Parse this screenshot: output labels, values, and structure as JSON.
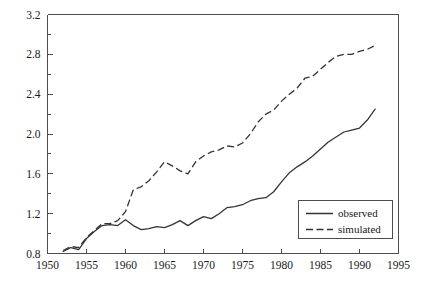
{
  "chart_data": {
    "type": "line",
    "title": "",
    "xlabel": "",
    "ylabel": "",
    "xlim": [
      1950,
      1995
    ],
    "ylim": [
      0.8,
      3.2
    ],
    "grid": false,
    "legend_position": "bottom-right",
    "x_ticks": [
      1950,
      1955,
      1960,
      1965,
      1970,
      1975,
      1980,
      1985,
      1990,
      1995
    ],
    "x_tick_labels": [
      "1950",
      "1955",
      "1960",
      "1965",
      "1970",
      "1975",
      "1980",
      "1985",
      "1990",
      "1995"
    ],
    "y_ticks": [
      0.8,
      1.2,
      1.6,
      2.0,
      2.4,
      2.8,
      3.2
    ],
    "y_tick_labels": [
      "0.8",
      "1.2",
      "1.6",
      "2.0",
      "2.4",
      "2.8",
      "3.2"
    ],
    "y_minor_ticks": [
      1.0,
      1.4,
      1.8,
      2.2,
      2.6,
      3.0
    ],
    "x": [
      1952,
      1953,
      1954,
      1955,
      1956,
      1957,
      1958,
      1959,
      1960,
      1961,
      1962,
      1963,
      1964,
      1965,
      1966,
      1967,
      1968,
      1969,
      1970,
      1971,
      1972,
      1973,
      1974,
      1975,
      1976,
      1977,
      1978,
      1979,
      1980,
      1981,
      1982,
      1983,
      1984,
      1985,
      1986,
      1987,
      1988,
      1989,
      1990,
      1991,
      1992
    ],
    "series": [
      {
        "name": "observed",
        "style": "solid",
        "color": "#333333",
        "values": [
          0.82,
          0.86,
          0.84,
          0.95,
          1.02,
          1.08,
          1.09,
          1.08,
          1.14,
          1.08,
          1.04,
          1.05,
          1.07,
          1.06,
          1.09,
          1.13,
          1.08,
          1.13,
          1.17,
          1.15,
          1.2,
          1.26,
          1.27,
          1.29,
          1.33,
          1.35,
          1.36,
          1.42,
          1.52,
          1.61,
          1.67,
          1.72,
          1.78,
          1.85,
          1.92,
          1.97,
          2.02,
          2.04,
          2.06,
          2.14,
          2.25
        ]
      },
      {
        "name": "simulated",
        "style": "dashed",
        "color": "#333333",
        "values": [
          0.83,
          0.87,
          0.86,
          0.96,
          1.03,
          1.1,
          1.1,
          1.13,
          1.22,
          1.44,
          1.47,
          1.53,
          1.62,
          1.72,
          1.68,
          1.63,
          1.6,
          1.72,
          1.78,
          1.82,
          1.84,
          1.88,
          1.87,
          1.91,
          2.0,
          2.12,
          2.2,
          2.24,
          2.33,
          2.4,
          2.46,
          2.56,
          2.58,
          2.65,
          2.72,
          2.78,
          2.8,
          2.8,
          2.83,
          2.85,
          2.89
        ]
      }
    ],
    "legend": [
      {
        "label": "observed",
        "style": "solid"
      },
      {
        "label": "simulated",
        "style": "dashed"
      }
    ]
  },
  "axes": {
    "x_tick_labels": [
      "1950",
      "1955",
      "1960",
      "1965",
      "1970",
      "1975",
      "1980",
      "1985",
      "1990",
      "1995"
    ],
    "y_tick_labels": [
      "0.8",
      "1.2",
      "1.6",
      "2.0",
      "2.4",
      "2.8",
      "3.2"
    ]
  },
  "legend": {
    "observed_label": "observed",
    "simulated_label": "simulated"
  },
  "colors": {
    "line": "#333333",
    "axis": "#4d4d4d",
    "background": "#ffffff"
  }
}
